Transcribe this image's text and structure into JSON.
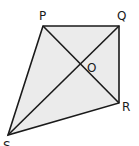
{
  "diagram": {
    "fill_color": "#ebebeb",
    "stroke_color": "#1a1a1a",
    "vertices": [
      {
        "name": "P",
        "x": 43,
        "y": 26
      },
      {
        "name": "Q",
        "x": 119,
        "y": 26
      },
      {
        "name": "R",
        "x": 119,
        "y": 103
      },
      {
        "name": "S",
        "x": 8,
        "y": 135
      }
    ],
    "intersection": {
      "name": "O",
      "x": 81,
      "y": 64
    },
    "labels": {
      "P": "P",
      "Q": "Q",
      "R": "R",
      "S": "S",
      "O": "O"
    },
    "edges": [
      "PQ",
      "QR",
      "RS",
      "SP"
    ],
    "diagonals": [
      "PR",
      "QS"
    ]
  }
}
